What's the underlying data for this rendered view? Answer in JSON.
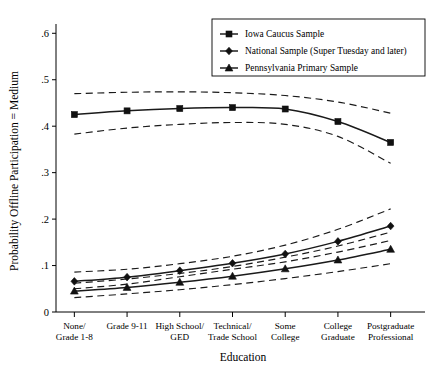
{
  "chart_data": {
    "type": "line",
    "title": "",
    "xlabel": "Education",
    "ylabel": "Probability Offline Participation = Medium",
    "categories": [
      "None/\nGrade 1-8",
      "Grade 9-11",
      "High School/\nGED",
      "Technical/\nTrade School",
      "Some\nCollege",
      "College\nGraduate",
      "Postgraduate\nProfessional"
    ],
    "category_lines": [
      [
        "None/",
        "Grade 1-8"
      ],
      [
        "Grade 9-11",
        ""
      ],
      [
        "High School/",
        "GED"
      ],
      [
        "Technical/",
        "Trade School"
      ],
      [
        "Some",
        "College"
      ],
      [
        "College",
        "Graduate"
      ],
      [
        "Postgraduate",
        "Professional"
      ]
    ],
    "x": [
      1,
      2,
      3,
      4,
      5,
      6,
      7
    ],
    "ylim": [
      0,
      0.62
    ],
    "yticks": [
      0,
      0.1,
      0.2,
      0.3,
      0.4,
      0.5,
      0.6
    ],
    "ytick_labels": [
      "0",
      ".1",
      ".2",
      ".3",
      ".4",
      ".5",
      ".6"
    ],
    "grid": false,
    "legend_position": "top-right",
    "series": [
      {
        "name": "Iowa Caucus Sample",
        "marker": "square",
        "values": [
          0.425,
          0.433,
          0.438,
          0.44,
          0.437,
          0.41,
          0.365
        ],
        "ci_upper": [
          0.47,
          0.473,
          0.474,
          0.472,
          0.466,
          0.452,
          0.428
        ],
        "ci_lower": [
          0.383,
          0.396,
          0.404,
          0.408,
          0.404,
          0.378,
          0.32
        ]
      },
      {
        "name": "National Sample (Super Tuesday and later)",
        "marker": "diamond",
        "values": [
          0.066,
          0.075,
          0.089,
          0.105,
          0.125,
          0.152,
          0.185
        ],
        "ci_upper": [
          0.086,
          0.092,
          0.104,
          0.12,
          0.144,
          0.178,
          0.222
        ],
        "ci_lower": [
          0.05,
          0.06,
          0.076,
          0.092,
          0.108,
          0.129,
          0.154
        ]
      },
      {
        "name": "Pennsylvania Primary Sample",
        "marker": "triangle",
        "values": [
          0.045,
          0.053,
          0.064,
          0.077,
          0.093,
          0.112,
          0.135
        ]
      },
      {
        "name": "Pennsylvania Primary Sample CI",
        "marker": "none",
        "ci_upper": [
          0.062,
          0.071,
          0.083,
          0.098,
          0.118,
          0.142,
          0.172
        ],
        "ci_lower": [
          0.031,
          0.039,
          0.048,
          0.059,
          0.072,
          0.087,
          0.104
        ]
      }
    ]
  },
  "legend": {
    "entries": [
      "Iowa Caucus Sample",
      "National Sample (Super Tuesday and later)",
      "Pennsylvania Primary Sample"
    ]
  }
}
